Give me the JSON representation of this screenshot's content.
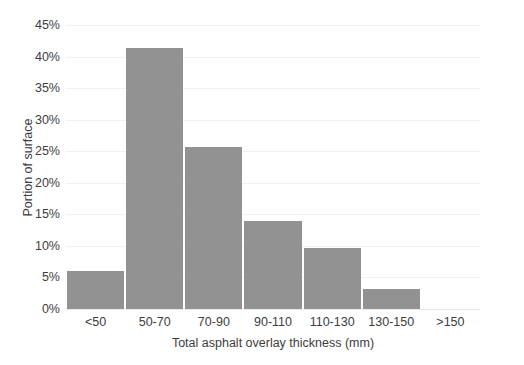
{
  "chart_data": {
    "type": "bar",
    "title": "",
    "subtitle": "",
    "xlabel": "Total asphalt overlay thickness (mm)",
    "ylabel": "Portion of surface",
    "categories": [
      "<50",
      "50-70",
      "70-90",
      "90-110",
      "110-130",
      "130-150",
      ">150"
    ],
    "values": [
      6.0,
      41.4,
      25.6,
      13.9,
      9.6,
      3.1,
      0.0
    ],
    "series": [
      {
        "name": "Portion of surface",
        "values": [
          6.0,
          41.4,
          25.6,
          13.9,
          9.6,
          3.1,
          0.0
        ]
      }
    ],
    "value_suffix": "%",
    "ylim": [
      0,
      45
    ],
    "ytick_values": [
      0,
      5,
      10,
      15,
      20,
      25,
      30,
      35,
      40,
      45
    ],
    "ytick_labels": [
      "0%",
      "5%",
      "10%",
      "15%",
      "20%",
      "25%",
      "30%",
      "35%",
      "40%",
      "45%"
    ],
    "xtick_labels": [
      "<50",
      "50-70",
      "70-90",
      "90-110",
      "110-130",
      "130-150",
      ">150"
    ],
    "grid": true,
    "grid_axis": "y",
    "legend": false,
    "legend_position": "none",
    "bar_color": "#929292",
    "grid_color": "#f2f2f2",
    "text_color": "#3d3d3d",
    "background_color": "#ffffff"
  }
}
